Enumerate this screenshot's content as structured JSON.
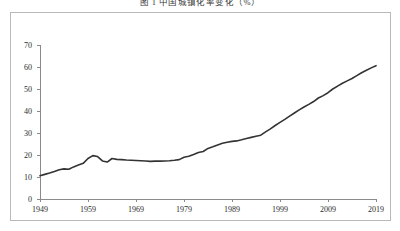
{
  "figure": {
    "title": "图 1  中国城镇化率变化（%）",
    "caption_visible": true
  },
  "axes": {
    "y_ticks": [
      "0",
      "10",
      "20",
      "30",
      "40",
      "50",
      "60",
      "70"
    ],
    "x_ticks": [
      "1949",
      "1959",
      "1969",
      "1979",
      "1989",
      "1999",
      "2009",
      "2019"
    ],
    "line_color": "#333333",
    "axis_color": "#8a8a8a",
    "frame_color": "#b9b9b9"
  },
  "chart_data": {
    "type": "line",
    "title": "图 1  中国城镇化率变化（%）",
    "xlabel": "",
    "ylabel": "",
    "xlim": [
      1949,
      2019
    ],
    "ylim": [
      0,
      70
    ],
    "grid": false,
    "legend": "none",
    "x_tick_labels": [
      "1949",
      "1959",
      "1969",
      "1979",
      "1989",
      "1999",
      "2009",
      "2019"
    ],
    "y_tick_labels": [
      "0",
      "10",
      "20",
      "30",
      "40",
      "50",
      "60",
      "70"
    ],
    "series": [
      {
        "name": "城镇化率",
        "x": [
          1949,
          1950,
          1951,
          1952,
          1953,
          1954,
          1955,
          1956,
          1957,
          1958,
          1959,
          1960,
          1961,
          1962,
          1963,
          1964,
          1965,
          1966,
          1967,
          1968,
          1969,
          1970,
          1971,
          1972,
          1973,
          1974,
          1975,
          1976,
          1977,
          1978,
          1979,
          1980,
          1981,
          1982,
          1983,
          1984,
          1985,
          1986,
          1987,
          1988,
          1989,
          1990,
          1991,
          1992,
          1993,
          1994,
          1995,
          1996,
          1997,
          1998,
          1999,
          2000,
          2001,
          2002,
          2003,
          2004,
          2005,
          2006,
          2007,
          2008,
          2009,
          2010,
          2011,
          2012,
          2013,
          2014,
          2015,
          2016,
          2017,
          2018,
          2019
        ],
        "values": [
          10.6,
          11.2,
          11.8,
          12.5,
          13.3,
          13.7,
          13.5,
          14.6,
          15.4,
          16.2,
          18.4,
          19.7,
          19.3,
          17.3,
          16.8,
          18.4,
          18.0,
          17.9,
          17.7,
          17.6,
          17.5,
          17.4,
          17.3,
          17.1,
          17.2,
          17.2,
          17.3,
          17.4,
          17.6,
          17.9,
          19.0,
          19.4,
          20.2,
          21.1,
          21.6,
          23.0,
          23.7,
          24.5,
          25.3,
          25.8,
          26.2,
          26.4,
          26.9,
          27.5,
          28.0,
          28.5,
          29.0,
          30.5,
          31.9,
          33.4,
          34.8,
          36.2,
          37.7,
          39.1,
          40.5,
          41.8,
          43.0,
          44.3,
          45.9,
          47.0,
          48.3,
          50.0,
          51.3,
          52.6,
          53.7,
          54.8,
          56.1,
          57.4,
          58.5,
          59.6,
          60.6
        ]
      }
    ]
  }
}
